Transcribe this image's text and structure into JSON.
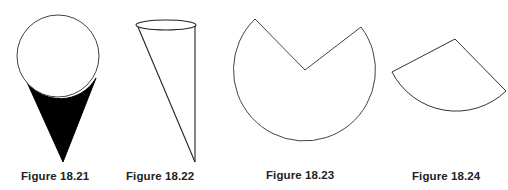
{
  "figures": [
    {
      "id": "18.21",
      "caption": "Figure 18.21",
      "shape": "sphere-on-cone",
      "fill_color": "#000000"
    },
    {
      "id": "18.22",
      "caption": "Figure 18.22",
      "shape": "oblique-cone"
    },
    {
      "id": "18.23",
      "caption": "Figure 18.23",
      "shape": "circle-with-sector-removed"
    },
    {
      "id": "18.24",
      "caption": "Figure 18.24",
      "shape": "circular-sector"
    }
  ],
  "colors": {
    "stroke": "#333333",
    "fill_dark": "#000000",
    "background": "#ffffff"
  }
}
